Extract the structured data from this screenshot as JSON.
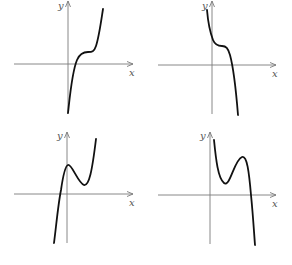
{
  "figure": {
    "axis_labels": {
      "x": "x",
      "y": "y"
    },
    "colors": {
      "axis": "#7a7a7a",
      "curve": "#111111",
      "background": "#ffffff"
    },
    "panels": [
      {
        "id": "top-left",
        "shape": "increasing cubic with inflection plateau above x-axis, crossing x-axis once at small positive x",
        "origin": [
          68,
          64
        ],
        "x_axis": [
          14,
          133
        ],
        "y_axis": [
          1,
          114
        ],
        "curve_path": "M68,113 C70,95 72,72 77,60 C80,53 84,52 88,52 C92,52 94,52 96,46 C99,37 101,22 103,9"
      },
      {
        "id": "top-right",
        "shape": "decreasing cubic with inflection plateau above x-axis, crossing x-axis once at positive x",
        "origin": [
          212,
          65
        ],
        "x_axis": [
          158,
          276
        ],
        "y_axis": [
          1,
          114
        ],
        "curve_path": "M207,10 C208,22 210,32 213,40 C215,45 218,46 222,46 C226,46 228,48 230,55 C233,66 236,90 238,115"
      },
      {
        "id": "bottom-left",
        "shape": "cubic with local max near y-axis and local min above x-axis, rising to the right",
        "origin": [
          67,
          194
        ],
        "x_axis": [
          14,
          133
        ],
        "y_axis": [
          132,
          243
        ],
        "curve_path": "M54,243 C56,228 58,205 61,190 C63,176 65,166 68,165 C72,164 78,183 84,185 C89,186 92,172 96,139"
      },
      {
        "id": "bottom-right",
        "shape": "cubic with local min and local max above x-axis, falling steeply to the right",
        "origin": [
          210,
          195
        ],
        "x_axis": [
          158,
          276
        ],
        "y_axis": [
          132,
          244
        ],
        "curve_path": "M214,140 C216,160 218,178 224,183 C230,188 234,160 242,157 C247,155 249,172 251,195 C253,215 254,232 255,245"
      }
    ]
  }
}
